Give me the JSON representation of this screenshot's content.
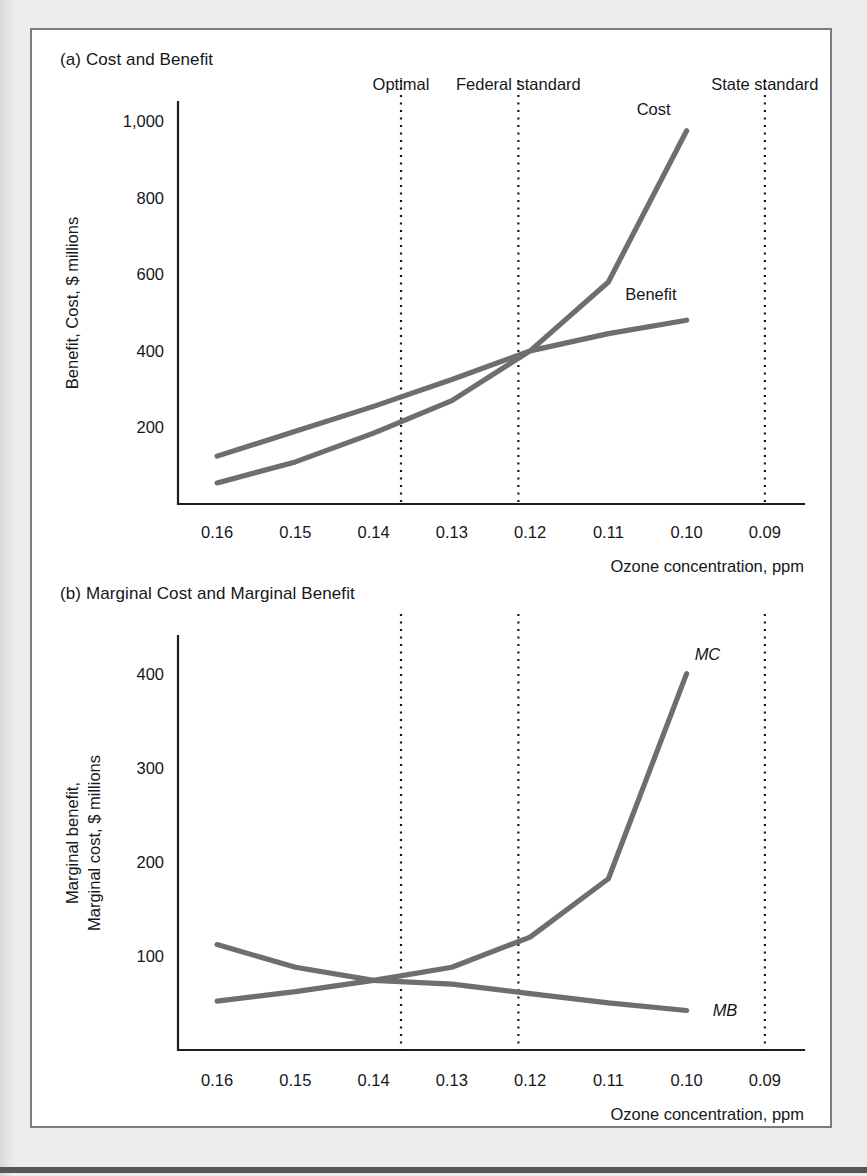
{
  "figure": {
    "panel_a_title": "(a) Cost and Benefit",
    "panel_b_title": "(b) Marginal Cost and Marginal Benefit"
  },
  "chart_data": [
    {
      "type": "line",
      "title": "(a) Cost and Benefit",
      "xlabel": "Ozone concentration, ppm",
      "ylabel": "Benefit, Cost, $ millions",
      "x": [
        0.16,
        0.15,
        0.14,
        0.13,
        0.12,
        0.11,
        0.1
      ],
      "xticks": [
        "0.16",
        "0.15",
        "0.14",
        "0.13",
        "0.12",
        "0.11",
        "0.10",
        "0.09"
      ],
      "xlim": [
        0.165,
        0.085
      ],
      "ylim": [
        0,
        1050
      ],
      "yticks": [
        200,
        400,
        600,
        800,
        1000
      ],
      "ytick_labels": [
        "200",
        "400",
        "600",
        "800",
        "1,000"
      ],
      "grid": false,
      "legend_position": "inline-labels",
      "series": [
        {
          "name": "Cost",
          "label": "Cost",
          "values": [
            55,
            110,
            185,
            270,
            400,
            580,
            975
          ]
        },
        {
          "name": "Benefit",
          "label": "Benefit",
          "values": [
            125,
            190,
            255,
            325,
            400,
            445,
            480
          ]
        }
      ],
      "annotations": [
        {
          "name": "Optimal",
          "label": "Optimal",
          "x": 0.1365
        },
        {
          "name": "Federal standard",
          "label": "Federal standard",
          "x": 0.1215
        },
        {
          "name": "State standard",
          "label": "State standard",
          "x": 0.09
        }
      ]
    },
    {
      "type": "line",
      "title": "(b) Marginal Cost and Marginal Benefit",
      "xlabel": "Ozone concentration, ppm",
      "ylabel": "Marginal benefit, Marginal cost, $ millions",
      "x": [
        0.16,
        0.15,
        0.14,
        0.13,
        0.12,
        0.11,
        0.1
      ],
      "xticks": [
        "0.16",
        "0.15",
        "0.14",
        "0.13",
        "0.12",
        "0.11",
        "0.10",
        "0.09"
      ],
      "xlim": [
        0.165,
        0.085
      ],
      "ylim": [
        0,
        440
      ],
      "yticks": [
        100,
        200,
        300,
        400
      ],
      "ytick_labels": [
        "100",
        "200",
        "300",
        "400"
      ],
      "grid": false,
      "legend_position": "inline-labels",
      "series": [
        {
          "name": "MC",
          "label": "MC",
          "values": [
            52,
            62,
            74,
            88,
            120,
            182,
            400
          ]
        },
        {
          "name": "MB",
          "label": "MB",
          "values": [
            112,
            88,
            74,
            70,
            60,
            50,
            42
          ]
        }
      ],
      "annotations": [
        {
          "name": "Optimal",
          "label": "",
          "x": 0.1365
        },
        {
          "name": "Federal standard",
          "label": "",
          "x": 0.1215
        },
        {
          "name": "State standard",
          "label": "",
          "x": 0.09
        }
      ]
    }
  ]
}
